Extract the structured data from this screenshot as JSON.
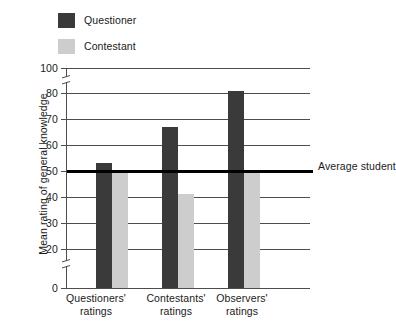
{
  "chart_data": {
    "type": "bar",
    "title": "",
    "subtitle": "",
    "xlabel": "",
    "ylabel": "Mean rating of general knowledge",
    "categories": [
      "Questioners' ratings",
      "Contestants' ratings",
      "Observers' ratings"
    ],
    "series": [
      {
        "name": "Questioner",
        "color": "#3a3a3a",
        "values": [
          53,
          67,
          82
        ]
      },
      {
        "name": "Contestant",
        "color": "#cdcdcd",
        "values": [
          50,
          41,
          50
        ]
      }
    ],
    "ylim": [
      0,
      100
    ],
    "ytick_labels": [
      "100",
      "80",
      "70",
      "60",
      "50",
      "40",
      "30",
      "20",
      "0"
    ],
    "ytick_values": [
      100,
      80,
      70,
      60,
      50,
      40,
      30,
      20,
      0
    ],
    "axis_breaks": [
      [
        0,
        20
      ],
      [
        80,
        100
      ]
    ],
    "grid": true,
    "grid_axis": "y",
    "legend_position": "top-left",
    "annotations": [
      {
        "name": "average-student-line",
        "text_line1": "Average",
        "text_line2": "student",
        "value": 50,
        "color": "#000000",
        "orientation": "horizontal"
      }
    ]
  },
  "legend": {
    "items": [
      {
        "label": "Questioner",
        "color": "#3a3a3a"
      },
      {
        "label": "Contestant",
        "color": "#cdcdcd"
      }
    ]
  },
  "yaxis": {
    "title": "Mean rating of general knowledge",
    "ticks": [
      {
        "label": "100",
        "value": 100
      },
      {
        "label": "80",
        "value": 80
      },
      {
        "label": "70",
        "value": 70
      },
      {
        "label": "60",
        "value": 60
      },
      {
        "label": "50",
        "value": 50
      },
      {
        "label": "40",
        "value": 40
      },
      {
        "label": "30",
        "value": 30
      },
      {
        "label": "20",
        "value": 20
      },
      {
        "label": "0",
        "value": 0
      }
    ]
  },
  "xaxis": {
    "groups": [
      {
        "line1": "Questioners'",
        "line2": "ratings"
      },
      {
        "line1": "Contestants'",
        "line2": "ratings"
      },
      {
        "line1": "Observers'",
        "line2": "ratings"
      }
    ]
  },
  "reference_line": {
    "line1": "Average",
    "line2": "student"
  }
}
